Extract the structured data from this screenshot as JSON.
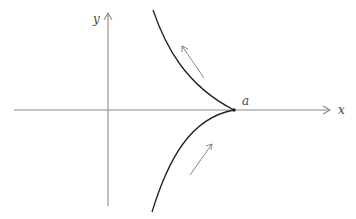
{
  "diagram": {
    "type": "cusp-curve",
    "axes": {
      "x_label": "x",
      "y_label": "y",
      "axis_color": "#8a8a8a"
    },
    "point": {
      "label": "a",
      "color": "#222222"
    },
    "curve_color": "#222222",
    "arrow_color": "#777777",
    "direction_arrows": [
      {
        "name": "upper",
        "direction": "up-left along upper branch"
      },
      {
        "name": "lower",
        "direction": "up-right along lower branch"
      }
    ]
  }
}
